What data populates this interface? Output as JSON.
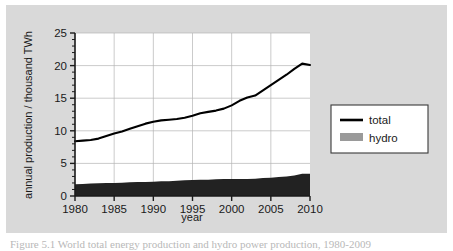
{
  "figure": {
    "background_color": "#d9d9d9",
    "plot_background_color": "#ffffff",
    "caption_partial": "Figure  5.1  World  total  energy  production  and  hydro  power  production,  1980-2009"
  },
  "chart_data": {
    "type": "area",
    "title": "",
    "xlabel": "year",
    "ylabel": "annual production / thousand TWh",
    "xlim": [
      1980,
      2010
    ],
    "ylim": [
      0,
      25
    ],
    "xticks": [
      1980,
      1985,
      1990,
      1995,
      2000,
      2005,
      2010
    ],
    "yticks": [
      0,
      5,
      10,
      15,
      20,
      25
    ],
    "xtick_labels": [
      "1980",
      "1985",
      "1990",
      "1995",
      "2000",
      "2005",
      "2010"
    ],
    "ytick_labels": [
      "0",
      "5",
      "10",
      "15",
      "20",
      "25"
    ],
    "y_minor_tick_step": 1,
    "grid": true,
    "legend_position": "right-outside",
    "x": [
      1980,
      1981,
      1982,
      1983,
      1984,
      1985,
      1986,
      1987,
      1988,
      1989,
      1990,
      1991,
      1992,
      1993,
      1994,
      1995,
      1996,
      1997,
      1998,
      1999,
      2000,
      2001,
      2002,
      2003,
      2004,
      2005,
      2006,
      2007,
      2008,
      2009,
      2010
    ],
    "series": [
      {
        "name": "total",
        "label": "total",
        "render": "line",
        "color": "#000000",
        "values": [
          8.4,
          8.5,
          8.6,
          8.8,
          9.2,
          9.6,
          9.9,
          10.3,
          10.7,
          11.1,
          11.4,
          11.6,
          11.7,
          11.8,
          12.0,
          12.3,
          12.7,
          12.9,
          13.1,
          13.4,
          13.9,
          14.6,
          15.1,
          15.4,
          16.2,
          17.0,
          17.8,
          18.6,
          19.5,
          20.3,
          20.1
        ]
      },
      {
        "name": "hydro",
        "label": "hydro",
        "render": "filled-area",
        "color": "#9a9a9a",
        "plot_fill_color": "#222222",
        "values": [
          1.8,
          1.85,
          1.9,
          1.95,
          2.0,
          2.0,
          2.05,
          2.1,
          2.15,
          2.15,
          2.2,
          2.25,
          2.25,
          2.35,
          2.4,
          2.45,
          2.5,
          2.5,
          2.55,
          2.6,
          2.6,
          2.6,
          2.6,
          2.65,
          2.75,
          2.8,
          2.9,
          3.0,
          3.15,
          3.4,
          3.4
        ]
      }
    ]
  },
  "legend": {
    "items": [
      {
        "label": "total",
        "swatch": "line",
        "color": "#000000"
      },
      {
        "label": "hydro",
        "swatch": "block",
        "color": "#9a9a9a"
      }
    ]
  }
}
